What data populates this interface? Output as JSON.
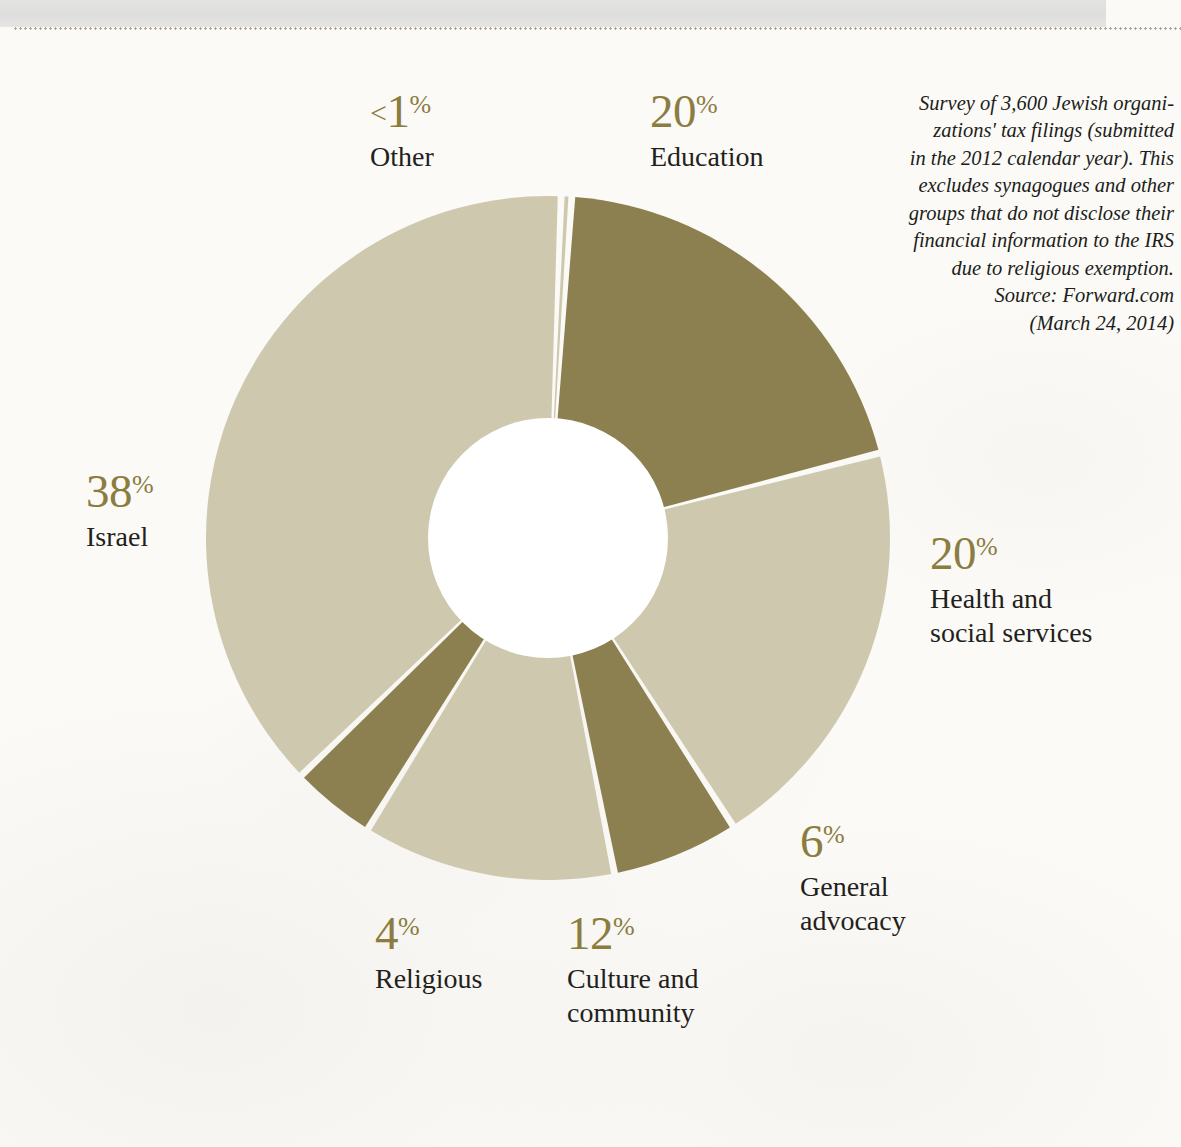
{
  "chart_data": {
    "type": "pie",
    "variant": "donut",
    "title": "",
    "subtitle": "",
    "xlabel": "",
    "ylabel": "",
    "unit": "%",
    "total": 100,
    "legend_position": "callout-labels-around-chart",
    "grid": false,
    "start_angle_deg": -86,
    "direction": "clockwise",
    "categories": [
      "Education",
      "Health and social services",
      "General advocacy",
      "Culture and community",
      "Religious",
      "Israel",
      "Other"
    ],
    "values": [
      20,
      20,
      6,
      12,
      4,
      38,
      0.5
    ],
    "slices": [
      {
        "label": "Education",
        "value": 20,
        "display": "20",
        "symbol": "%",
        "prefix": "",
        "tone": "dark",
        "color": "#8c8050"
      },
      {
        "label": "Health and social services",
        "value": 20,
        "display": "20",
        "symbol": "%",
        "prefix": "",
        "tone": "light",
        "color": "#cdc8ae"
      },
      {
        "label": "General advocacy",
        "value": 6,
        "display": "6",
        "symbol": "%",
        "prefix": "",
        "tone": "dark",
        "color": "#8c8050"
      },
      {
        "label": "Culture and community",
        "value": 12,
        "display": "12",
        "symbol": "%",
        "prefix": "",
        "tone": "light",
        "color": "#cdc8ae"
      },
      {
        "label": "Religious",
        "value": 4,
        "display": "4",
        "symbol": "%",
        "prefix": "",
        "tone": "dark",
        "color": "#8c8050"
      },
      {
        "label": "Israel",
        "value": 38,
        "display": "38",
        "symbol": "%",
        "prefix": "",
        "tone": "light",
        "color": "#cdc8ae"
      },
      {
        "label": "Other",
        "value": 0.5,
        "display": "1",
        "symbol": "%",
        "prefix": "<",
        "tone": "light",
        "color": "#cdc8ae"
      }
    ],
    "annotations": [
      "Survey of 3,600 Jewish organizations' tax filings (submitted in the 2012 calendar year). This excludes synagogues and other groups that do not disclose their financial information to the IRS due to religious exemption.",
      "Source: Forward.com (March 24, 2014)"
    ]
  },
  "labels": {
    "other": {
      "value": "1",
      "prefix": "<",
      "symbol": "%",
      "caption": "Other"
    },
    "education": {
      "value": "20",
      "prefix": "",
      "symbol": "%",
      "caption": "Education"
    },
    "israel": {
      "value": "38",
      "prefix": "",
      "symbol": "%",
      "caption": "Israel"
    },
    "health": {
      "value": "20",
      "prefix": "",
      "symbol": "%",
      "caption_line1": "Health and",
      "caption_line2": "social services"
    },
    "advocacy": {
      "value": "6",
      "prefix": "",
      "symbol": "%",
      "caption_line1": "General",
      "caption_line2": "advocacy"
    },
    "culture": {
      "value": "12",
      "prefix": "",
      "symbol": "%",
      "caption_line1": "Culture and",
      "caption_line2": "community"
    },
    "religious": {
      "value": "4",
      "prefix": "",
      "symbol": "%",
      "caption": "Religious"
    }
  },
  "source_note": {
    "line1": "Survey of 3,600 Jewish organi-",
    "line2": "zations' tax filings (submitted",
    "line3": "in the 2012 calendar year). This",
    "line4": "excludes synagogues and other",
    "line5": "groups that do not disclose their",
    "line6": "financial information to the IRS",
    "line7": "due to religious exemption.",
    "line8": "Source: Forward.com",
    "line9": "(March 24, 2014)"
  },
  "colors": {
    "dark_olive": "#8c8050",
    "light_olive": "#cdc8ae",
    "percent_text": "#8b7c3f",
    "label_text": "#231f1c",
    "paper": "#fbfaf7",
    "gap": "#ffffff"
  }
}
